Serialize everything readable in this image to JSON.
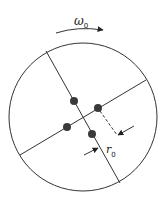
{
  "diagram": {
    "rotation_label": "ω",
    "rotation_subscript": "0",
    "radius_label": "r",
    "radius_subscript": "0",
    "colors": {
      "line": "#333333",
      "dot": "#3a3a3a",
      "background": "#ffffff"
    },
    "elements": {
      "disc": "circle",
      "axes": 2,
      "masses": 4
    }
  }
}
